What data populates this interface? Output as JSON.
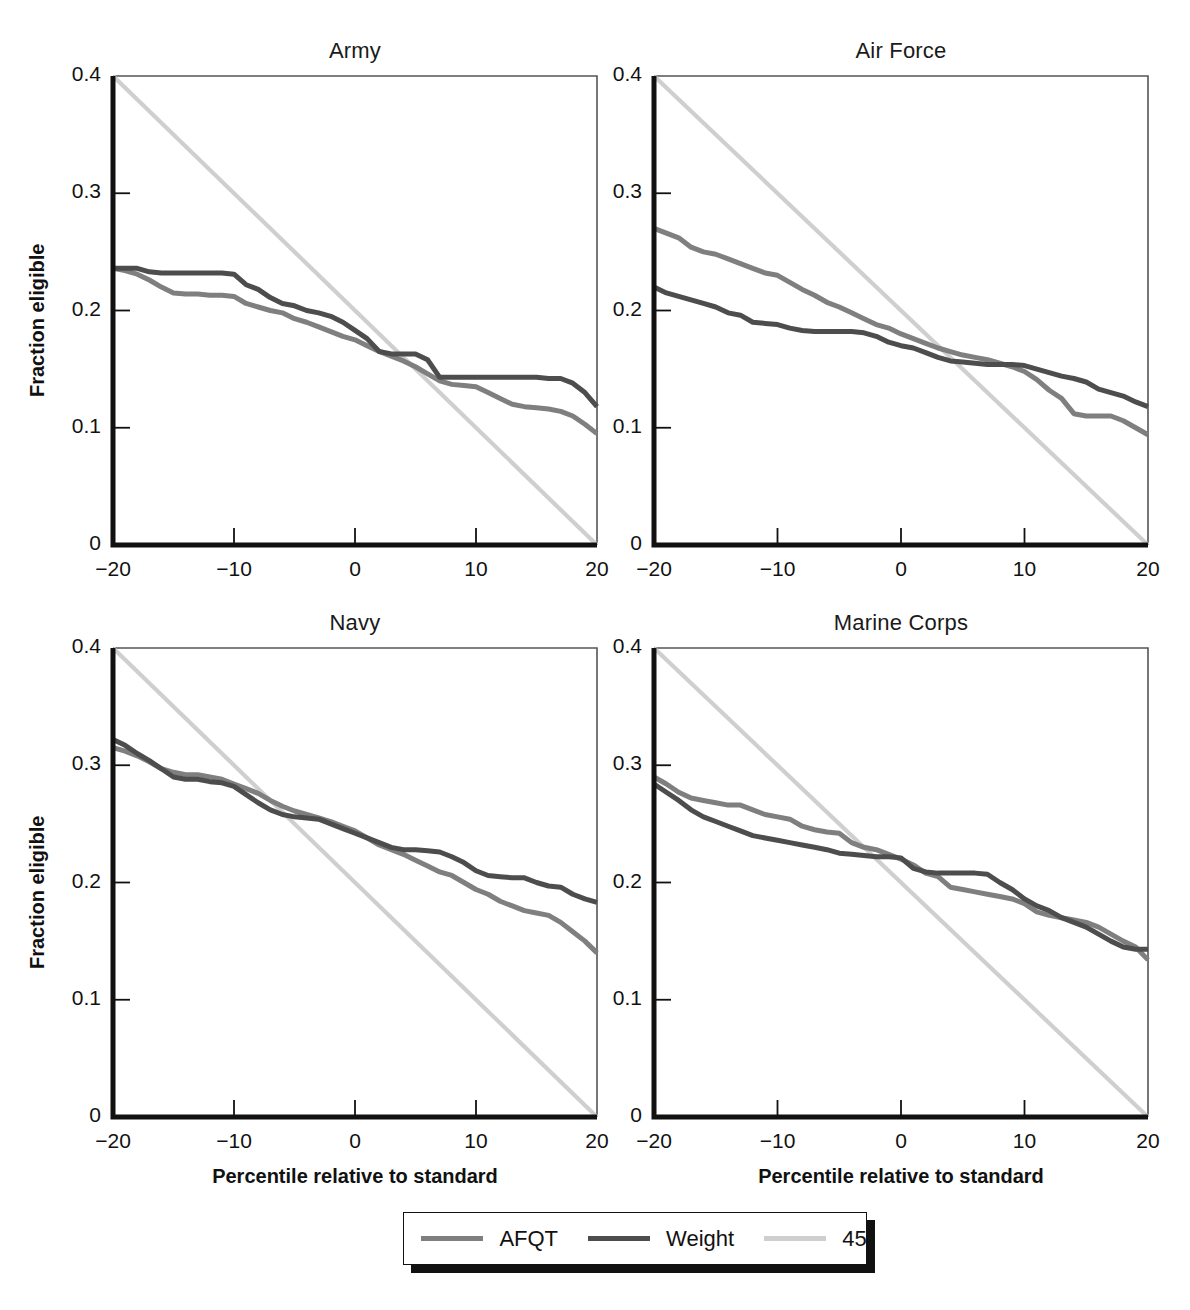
{
  "figure": {
    "xlabel": "Percentile relative to standard",
    "ylabel": "Fraction eligible",
    "xticks": [
      "−20",
      "−10",
      "0",
      "10",
      "20"
    ],
    "yticks": [
      "0",
      "0.1",
      "0.2",
      "0.3",
      "0.4"
    ],
    "colors": {
      "afqt": "#7f7f7f",
      "weight": "#4d4d4d",
      "fortyfive": "#cfcfcf",
      "axis": "#111111",
      "frame": "#555555"
    }
  },
  "legend": {
    "items": [
      {
        "label": "AFQT",
        "color_key": "afqt"
      },
      {
        "label": "Weight",
        "color_key": "weight"
      },
      {
        "label": "45",
        "color_key": "fortyfive"
      }
    ]
  },
  "chart_data": [
    {
      "type": "line",
      "title": "Army",
      "xlabel": "Percentile relative to standard",
      "ylabel": "Fraction eligible",
      "xlim": [
        -20,
        20
      ],
      "ylim": [
        0,
        0.4
      ],
      "xticks": [
        -20,
        -10,
        0,
        10,
        20
      ],
      "yticks": [
        0,
        0.1,
        0.2,
        0.3,
        0.4
      ],
      "grid": false,
      "legend_position": "bottom-outside",
      "series": [
        {
          "name": "AFQT",
          "x": [
            -20,
            -19,
            -18,
            -17,
            -16,
            -15,
            -14,
            -13,
            -12,
            -11,
            -10,
            -9,
            -8,
            -7,
            -6,
            -5,
            -4,
            -3,
            -2,
            -1,
            0,
            1,
            2,
            3,
            4,
            5,
            6,
            7,
            8,
            9,
            10,
            11,
            12,
            13,
            14,
            15,
            16,
            17,
            18,
            19,
            20
          ],
          "y": [
            0.236,
            0.234,
            0.231,
            0.226,
            0.22,
            0.215,
            0.214,
            0.214,
            0.213,
            0.213,
            0.212,
            0.206,
            0.203,
            0.2,
            0.198,
            0.193,
            0.19,
            0.186,
            0.182,
            0.178,
            0.175,
            0.17,
            0.165,
            0.161,
            0.157,
            0.152,
            0.146,
            0.14,
            0.137,
            0.136,
            0.135,
            0.13,
            0.125,
            0.12,
            0.118,
            0.117,
            0.116,
            0.114,
            0.11,
            0.103,
            0.095
          ]
        },
        {
          "name": "Weight",
          "x": [
            -20,
            -19,
            -18,
            -17,
            -16,
            -15,
            -14,
            -13,
            -12,
            -11,
            -10,
            -9,
            -8,
            -7,
            -6,
            -5,
            -4,
            -3,
            -2,
            -1,
            0,
            1,
            2,
            3,
            4,
            5,
            6,
            7,
            8,
            9,
            10,
            11,
            12,
            13,
            14,
            15,
            16,
            17,
            18,
            19,
            20
          ],
          "y": [
            0.236,
            0.236,
            0.236,
            0.233,
            0.232,
            0.232,
            0.232,
            0.232,
            0.232,
            0.232,
            0.231,
            0.222,
            0.218,
            0.211,
            0.206,
            0.204,
            0.2,
            0.198,
            0.195,
            0.19,
            0.183,
            0.176,
            0.165,
            0.163,
            0.163,
            0.163,
            0.158,
            0.143,
            0.143,
            0.143,
            0.143,
            0.143,
            0.143,
            0.143,
            0.143,
            0.143,
            0.142,
            0.142,
            0.138,
            0.13,
            0.118
          ]
        },
        {
          "name": "45",
          "x": [
            -20,
            20
          ],
          "y": [
            0.4,
            0.0
          ]
        }
      ]
    },
    {
      "type": "line",
      "title": "Air Force",
      "xlabel": "Percentile relative to standard",
      "ylabel": "Fraction eligible",
      "xlim": [
        -20,
        20
      ],
      "ylim": [
        0,
        0.4
      ],
      "xticks": [
        -20,
        -10,
        0,
        10,
        20
      ],
      "yticks": [
        0,
        0.1,
        0.2,
        0.3,
        0.4
      ],
      "grid": false,
      "legend_position": "bottom-outside",
      "series": [
        {
          "name": "AFQT",
          "x": [
            -20,
            -19,
            -18,
            -17,
            -16,
            -15,
            -14,
            -13,
            -12,
            -11,
            -10,
            -9,
            -8,
            -7,
            -6,
            -5,
            -4,
            -3,
            -2,
            -1,
            0,
            1,
            2,
            3,
            4,
            5,
            6,
            7,
            8,
            9,
            10,
            11,
            12,
            13,
            14,
            15,
            16,
            17,
            18,
            19,
            20
          ],
          "y": [
            0.27,
            0.266,
            0.262,
            0.254,
            0.25,
            0.248,
            0.244,
            0.24,
            0.236,
            0.232,
            0.23,
            0.224,
            0.218,
            0.213,
            0.207,
            0.203,
            0.198,
            0.193,
            0.188,
            0.185,
            0.18,
            0.176,
            0.172,
            0.168,
            0.165,
            0.162,
            0.16,
            0.158,
            0.155,
            0.152,
            0.148,
            0.141,
            0.132,
            0.125,
            0.112,
            0.11,
            0.11,
            0.11,
            0.106,
            0.1,
            0.094
          ]
        },
        {
          "name": "Weight",
          "x": [
            -20,
            -19,
            -18,
            -17,
            -16,
            -15,
            -14,
            -13,
            -12,
            -11,
            -10,
            -9,
            -8,
            -7,
            -6,
            -5,
            -4,
            -3,
            -2,
            -1,
            0,
            1,
            2,
            3,
            4,
            5,
            6,
            7,
            8,
            9,
            10,
            11,
            12,
            13,
            14,
            15,
            16,
            17,
            18,
            19,
            20
          ],
          "y": [
            0.22,
            0.215,
            0.212,
            0.209,
            0.206,
            0.203,
            0.198,
            0.196,
            0.19,
            0.189,
            0.188,
            0.185,
            0.183,
            0.182,
            0.182,
            0.182,
            0.182,
            0.181,
            0.178,
            0.173,
            0.17,
            0.168,
            0.164,
            0.16,
            0.157,
            0.156,
            0.155,
            0.154,
            0.154,
            0.154,
            0.153,
            0.15,
            0.147,
            0.144,
            0.142,
            0.139,
            0.133,
            0.13,
            0.127,
            0.122,
            0.118
          ]
        },
        {
          "name": "45",
          "x": [
            -20,
            20
          ],
          "y": [
            0.4,
            0.0
          ]
        }
      ]
    },
    {
      "type": "line",
      "title": "Navy",
      "xlabel": "Percentile relative to standard",
      "ylabel": "Fraction eligible",
      "xlim": [
        -20,
        20
      ],
      "ylim": [
        0,
        0.4
      ],
      "xticks": [
        -20,
        -10,
        0,
        10,
        20
      ],
      "yticks": [
        0,
        0.1,
        0.2,
        0.3,
        0.4
      ],
      "grid": false,
      "legend_position": "bottom-outside",
      "series": [
        {
          "name": "AFQT",
          "x": [
            -20,
            -19,
            -18,
            -17,
            -16,
            -15,
            -14,
            -13,
            -12,
            -11,
            -10,
            -9,
            -8,
            -7,
            -6,
            -5,
            -4,
            -3,
            -2,
            -1,
            0,
            1,
            2,
            3,
            4,
            5,
            6,
            7,
            8,
            9,
            10,
            11,
            12,
            13,
            14,
            15,
            16,
            17,
            18,
            19,
            20
          ],
          "y": [
            0.315,
            0.312,
            0.308,
            0.303,
            0.297,
            0.294,
            0.292,
            0.292,
            0.29,
            0.288,
            0.284,
            0.28,
            0.276,
            0.27,
            0.265,
            0.261,
            0.258,
            0.255,
            0.252,
            0.248,
            0.244,
            0.238,
            0.232,
            0.228,
            0.224,
            0.219,
            0.214,
            0.209,
            0.206,
            0.2,
            0.194,
            0.19,
            0.184,
            0.18,
            0.176,
            0.174,
            0.172,
            0.166,
            0.158,
            0.15,
            0.14
          ]
        },
        {
          "name": "Weight",
          "x": [
            -20,
            -19,
            -18,
            -17,
            -16,
            -15,
            -14,
            -13,
            -12,
            -11,
            -10,
            -9,
            -8,
            -7,
            -6,
            -5,
            -4,
            -3,
            -2,
            -1,
            0,
            1,
            2,
            3,
            4,
            5,
            6,
            7,
            8,
            9,
            10,
            11,
            12,
            13,
            14,
            15,
            16,
            17,
            18,
            19,
            20
          ],
          "y": [
            0.322,
            0.317,
            0.31,
            0.304,
            0.297,
            0.29,
            0.288,
            0.288,
            0.286,
            0.285,
            0.282,
            0.275,
            0.268,
            0.262,
            0.258,
            0.256,
            0.255,
            0.254,
            0.25,
            0.246,
            0.242,
            0.238,
            0.234,
            0.23,
            0.228,
            0.228,
            0.227,
            0.226,
            0.222,
            0.217,
            0.21,
            0.206,
            0.205,
            0.204,
            0.204,
            0.2,
            0.197,
            0.196,
            0.19,
            0.186,
            0.183
          ]
        },
        {
          "name": "45",
          "x": [
            -20,
            20
          ],
          "y": [
            0.4,
            0.0
          ]
        }
      ]
    },
    {
      "type": "line",
      "title": "Marine Corps",
      "xlabel": "Percentile relative to standard",
      "ylabel": "Fraction eligible",
      "xlim": [
        -20,
        20
      ],
      "ylim": [
        0,
        0.4
      ],
      "xticks": [
        -20,
        -10,
        0,
        10,
        20
      ],
      "yticks": [
        0,
        0.1,
        0.2,
        0.3,
        0.4
      ],
      "grid": false,
      "legend_position": "bottom-outside",
      "series": [
        {
          "name": "AFQT",
          "x": [
            -20,
            -19,
            -18,
            -17,
            -16,
            -15,
            -14,
            -13,
            -12,
            -11,
            -10,
            -9,
            -8,
            -7,
            -6,
            -5,
            -4,
            -3,
            -2,
            -1,
            0,
            1,
            2,
            3,
            4,
            5,
            6,
            7,
            8,
            9,
            10,
            11,
            12,
            13,
            14,
            15,
            16,
            17,
            18,
            19,
            20
          ],
          "y": [
            0.29,
            0.284,
            0.277,
            0.272,
            0.27,
            0.268,
            0.266,
            0.266,
            0.262,
            0.258,
            0.256,
            0.254,
            0.248,
            0.245,
            0.243,
            0.242,
            0.234,
            0.23,
            0.228,
            0.224,
            0.22,
            0.215,
            0.208,
            0.205,
            0.196,
            0.194,
            0.192,
            0.19,
            0.188,
            0.186,
            0.182,
            0.175,
            0.172,
            0.17,
            0.168,
            0.166,
            0.162,
            0.156,
            0.15,
            0.145,
            0.134
          ]
        },
        {
          "name": "Weight",
          "x": [
            -20,
            -19,
            -18,
            -17,
            -16,
            -15,
            -14,
            -13,
            -12,
            -11,
            -10,
            -9,
            -8,
            -7,
            -6,
            -5,
            -4,
            -3,
            -2,
            -1,
            0,
            1,
            2,
            3,
            4,
            5,
            6,
            7,
            8,
            9,
            10,
            11,
            12,
            13,
            14,
            15,
            16,
            17,
            18,
            19,
            20
          ],
          "y": [
            0.284,
            0.277,
            0.27,
            0.262,
            0.256,
            0.252,
            0.248,
            0.244,
            0.24,
            0.238,
            0.236,
            0.234,
            0.232,
            0.23,
            0.228,
            0.225,
            0.224,
            0.223,
            0.222,
            0.222,
            0.221,
            0.212,
            0.209,
            0.208,
            0.208,
            0.208,
            0.208,
            0.207,
            0.2,
            0.194,
            0.186,
            0.18,
            0.176,
            0.17,
            0.166,
            0.162,
            0.156,
            0.15,
            0.145,
            0.143,
            0.143
          ]
        },
        {
          "name": "45",
          "x": [
            -20,
            20
          ],
          "y": [
            0.4,
            0.0
          ]
        }
      ]
    }
  ]
}
